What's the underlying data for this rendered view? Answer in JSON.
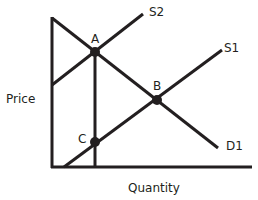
{
  "diagram": {
    "type": "supply-demand",
    "axes": {
      "y_label": "Price",
      "x_label": "Quantity"
    },
    "curves": [
      {
        "id": "S2",
        "label": "S2",
        "kind": "supply"
      },
      {
        "id": "S1",
        "label": "S1",
        "kind": "supply"
      },
      {
        "id": "D1",
        "label": "D1",
        "kind": "demand"
      }
    ],
    "points": [
      {
        "id": "A",
        "label": "A",
        "description": "intersection of S2 and D1"
      },
      {
        "id": "B",
        "label": "B",
        "description": "intersection of S1 and D1"
      },
      {
        "id": "C",
        "label": "C",
        "description": "point on S1 directly below A"
      }
    ],
    "colors": {
      "line": "#231f20",
      "background": "#ffffff"
    }
  }
}
